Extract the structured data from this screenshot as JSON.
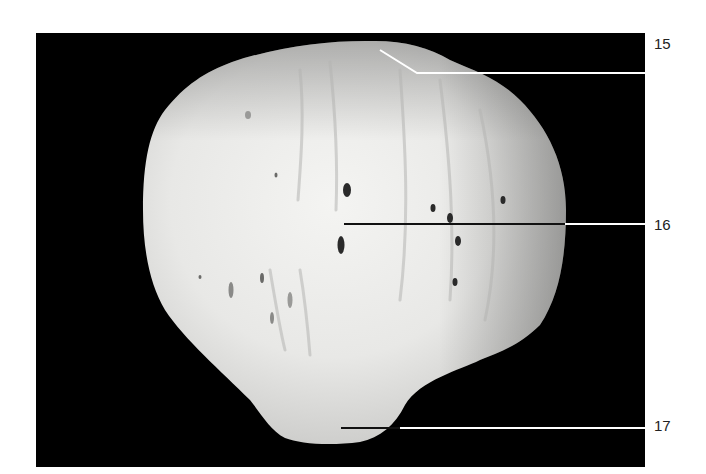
{
  "figure": {
    "background_color": "#000000",
    "page_color": "#ffffff",
    "labels": [
      {
        "id": "15",
        "text": "15",
        "x": 654,
        "y": 36
      },
      {
        "id": "16",
        "text": "16",
        "x": 654,
        "y": 217
      },
      {
        "id": "17",
        "text": "17",
        "x": 654,
        "y": 418
      }
    ]
  }
}
